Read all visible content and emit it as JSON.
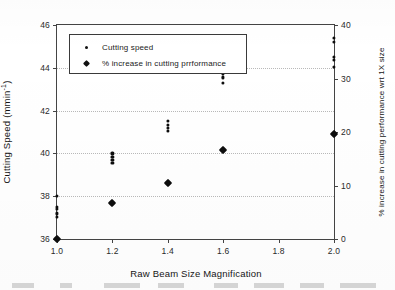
{
  "chart_data": {
    "type": "scatter",
    "title": "",
    "xlabel": "Raw Beam Size Magnification",
    "ylabel": "Cutting Speed (mmin-1)",
    "ylabel_right": "% increase in cutting performance wrt 1X size",
    "xlim": [
      1.0,
      2.0
    ],
    "ylim": [
      36,
      46
    ],
    "ylim_right": [
      0,
      40
    ],
    "grid": "horizontal-dotted",
    "legend_position": "top-left-inside",
    "xticks": [
      "1.0",
      "1.2",
      "1.4",
      "1.6",
      "1.8",
      "2.0"
    ],
    "xtick_values": [
      1.0,
      1.2,
      1.4,
      1.6,
      1.8,
      2.0
    ],
    "yticks_left": [
      "36",
      "38",
      "40",
      "42",
      "44",
      "46"
    ],
    "ytick_values_left": [
      36,
      38,
      40,
      42,
      44,
      46
    ],
    "yticks_right": [
      "0",
      "10",
      "20",
      "30",
      "40"
    ],
    "ytick_values_right": [
      0,
      10,
      20,
      30,
      40
    ],
    "gridline_values": [
      38,
      40,
      42,
      44
    ],
    "series": [
      {
        "name": "Cutting speed",
        "marker": "small-dot",
        "axis": "left",
        "points": [
          {
            "x": 1.0,
            "y": 38.0
          },
          {
            "x": 1.0,
            "y": 37.5
          },
          {
            "x": 1.0,
            "y": 37.4
          },
          {
            "x": 1.0,
            "y": 37.2
          },
          {
            "x": 1.0,
            "y": 37.05
          },
          {
            "x": 1.2,
            "y": 40.0
          },
          {
            "x": 1.2,
            "y": 39.85
          },
          {
            "x": 1.2,
            "y": 39.7
          },
          {
            "x": 1.2,
            "y": 39.55
          },
          {
            "x": 1.4,
            "y": 41.5
          },
          {
            "x": 1.4,
            "y": 41.35
          },
          {
            "x": 1.4,
            "y": 41.2
          },
          {
            "x": 1.4,
            "y": 41.05
          },
          {
            "x": 1.6,
            "y": 43.9
          },
          {
            "x": 1.6,
            "y": 43.7
          },
          {
            "x": 1.6,
            "y": 43.55
          },
          {
            "x": 1.6,
            "y": 43.3
          },
          {
            "x": 2.0,
            "y": 45.4
          },
          {
            "x": 2.0,
            "y": 45.2
          },
          {
            "x": 2.0,
            "y": 44.5
          },
          {
            "x": 2.0,
            "y": 44.35
          },
          {
            "x": 2.0,
            "y": 44.05
          }
        ]
      },
      {
        "name": "% increase in cutting prrformance",
        "marker": "diamond",
        "axis": "right",
        "points": [
          {
            "x": 1.0,
            "y": 0
          },
          {
            "x": 1.2,
            "y": 6.8
          },
          {
            "x": 1.4,
            "y": 10.5
          },
          {
            "x": 1.6,
            "y": 16.6
          },
          {
            "x": 2.0,
            "y": 19.7
          }
        ]
      }
    ]
  },
  "legend": {
    "items": [
      {
        "label": "Cutting speed",
        "marker": "small-dot"
      },
      {
        "label": "% increase in cutting prrformance",
        "marker": "diamond"
      }
    ]
  },
  "axes": {
    "x_title": "Raw Beam Size Magnification",
    "y_title_left_main": "Cutting Speed (mmin",
    "y_title_left_sup": "-1",
    "y_title_left_close": ")",
    "y_title_right": "% increase in cutting performance wrt 1X size"
  }
}
